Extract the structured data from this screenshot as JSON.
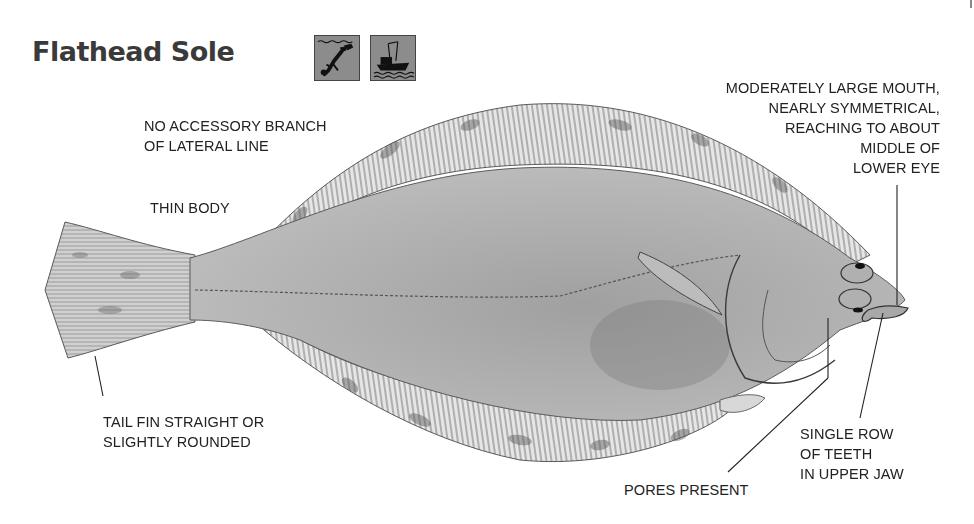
{
  "header": {
    "title": "Flathead Sole",
    "habitat_icons": [
      {
        "name": "diver-icon",
        "meaning": "scuba diver"
      },
      {
        "name": "fishing-boat-icon",
        "meaning": "fishing boat"
      }
    ]
  },
  "labels": {
    "lateral_line": "NO ACCESSORY BRANCH\nOF LATERAL LINE",
    "thin_body": "THIN BODY",
    "mouth": "MODERATELY LARGE MOUTH,\nNEARLY SYMMETRICAL,\nREACHING TO ABOUT\nMIDDLE OF\nLOWER EYE",
    "tail_fin": "TAIL FIN STRAIGHT OR\nSLIGHTLY ROUNDED",
    "pores": "PORES PRESENT",
    "teeth": "SINGLE ROW\nOF TEETH\nIN UPPER JAW"
  },
  "colors": {
    "body": "#a9a9a9",
    "fin": "#d8d8d8",
    "outline": "#4a4a4a",
    "icon_bg": "#8c8c8c",
    "text": "#222222"
  }
}
